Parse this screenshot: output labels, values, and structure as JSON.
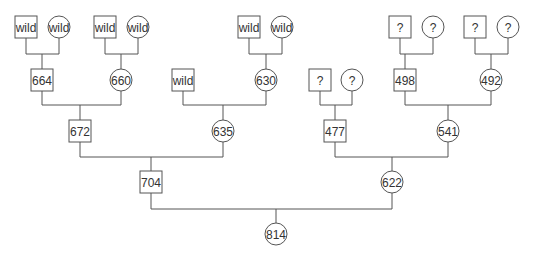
{
  "nodes": [
    {
      "id": "a1",
      "label": "wild",
      "shape": "square",
      "cx": 26,
      "cy": 27
    },
    {
      "id": "a2",
      "label": "wild",
      "shape": "circle",
      "cx": 59,
      "cy": 27
    },
    {
      "id": "a3",
      "label": "wild",
      "shape": "square",
      "cx": 105,
      "cy": 27
    },
    {
      "id": "a4",
      "label": "wild",
      "shape": "circle",
      "cx": 138,
      "cy": 27
    },
    {
      "id": "a5",
      "label": "wild",
      "shape": "square",
      "cx": 249,
      "cy": 27
    },
    {
      "id": "a6",
      "label": "wild",
      "shape": "circle",
      "cx": 282,
      "cy": 27
    },
    {
      "id": "a7",
      "label": "?",
      "shape": "square",
      "cx": 400,
      "cy": 27
    },
    {
      "id": "a8",
      "label": "?",
      "shape": "circle",
      "cx": 433,
      "cy": 27
    },
    {
      "id": "a9",
      "label": "?",
      "shape": "square",
      "cx": 475,
      "cy": 27
    },
    {
      "id": "a10",
      "label": "?",
      "shape": "circle",
      "cx": 508,
      "cy": 27
    },
    {
      "id": "b1",
      "label": "664",
      "shape": "square",
      "cx": 42,
      "cy": 80
    },
    {
      "id": "b2",
      "label": "660",
      "shape": "circle",
      "cx": 121,
      "cy": 80
    },
    {
      "id": "b3",
      "label": "wild",
      "shape": "square",
      "cx": 183,
      "cy": 80
    },
    {
      "id": "b4",
      "label": "630",
      "shape": "circle",
      "cx": 266,
      "cy": 80
    },
    {
      "id": "b5",
      "label": "?",
      "shape": "square",
      "cx": 320,
      "cy": 80
    },
    {
      "id": "b6",
      "label": "?",
      "shape": "circle",
      "cx": 352,
      "cy": 80
    },
    {
      "id": "b7",
      "label": "498",
      "shape": "square",
      "cx": 405,
      "cy": 80
    },
    {
      "id": "b8",
      "label": "492",
      "shape": "circle",
      "cx": 491,
      "cy": 80
    },
    {
      "id": "c1",
      "label": "672",
      "shape": "square",
      "cx": 80,
      "cy": 131
    },
    {
      "id": "c2",
      "label": "635",
      "shape": "circle",
      "cx": 223,
      "cy": 131
    },
    {
      "id": "c3",
      "label": "477",
      "shape": "square",
      "cx": 335,
      "cy": 131
    },
    {
      "id": "c4",
      "label": "541",
      "shape": "circle",
      "cx": 448,
      "cy": 131
    },
    {
      "id": "d1",
      "label": "704",
      "shape": "square",
      "cx": 151,
      "cy": 182
    },
    {
      "id": "d2",
      "label": "622",
      "shape": "circle",
      "cx": 392,
      "cy": 182
    },
    {
      "id": "e1",
      "label": "814",
      "shape": "circle",
      "cx": 276,
      "cy": 234
    }
  ],
  "matings": [
    {
      "p1": "a1",
      "p2": "a2",
      "barY": 54,
      "child": "b1"
    },
    {
      "p1": "a3",
      "p2": "a4",
      "barY": 54,
      "child": "b2"
    },
    {
      "p1": "a5",
      "p2": "a6",
      "barY": 54,
      "child": "b4"
    },
    {
      "p1": "a7",
      "p2": "a8",
      "barY": 54,
      "child": "b5x"
    },
    {
      "p1": "a9",
      "p2": "a10",
      "barY": 54,
      "child": "b8"
    },
    {
      "p1": "b1",
      "p2": "b2",
      "barY": 105,
      "child": "c1"
    },
    {
      "p1": "b3",
      "p2": "b4",
      "barY": 105,
      "child": "c2"
    },
    {
      "p1": "b5",
      "p2": "b6",
      "barY": 105,
      "child": "c3"
    },
    {
      "p1": "b7",
      "p2": "b8",
      "barY": 105,
      "child": "c4"
    },
    {
      "p1": "c1",
      "p2": "c2",
      "barY": 157,
      "child": "d1"
    },
    {
      "p1": "c3",
      "p2": "c4",
      "barY": 157,
      "child": "d2"
    },
    {
      "p1": "d1",
      "p2": "d2",
      "barY": 209,
      "child": "e1"
    }
  ]
}
